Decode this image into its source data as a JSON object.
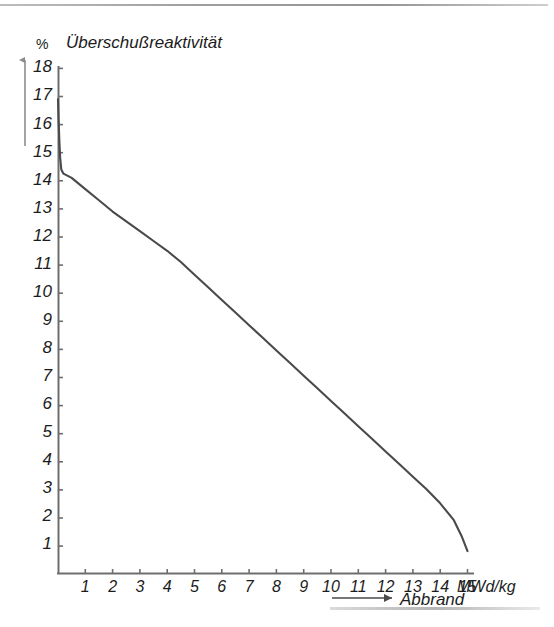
{
  "page": {
    "background": "#ffffff",
    "ink_color": "#2b2b2b",
    "axis_color": "#6e6e6e",
    "curve_color": "#4a4a4a"
  },
  "chart_data": {
    "type": "line",
    "title": "Überschußreaktivität",
    "xlabel": "Abbrand",
    "ylabel": "%",
    "x_unit": "15MWd/kg",
    "x_unit_text": "MWd/kg",
    "xlim": [
      0,
      15.5
    ],
    "ylim": [
      0,
      18
    ],
    "grid": false,
    "legend": "Abbrand",
    "legend_position": "below-x-axis-right",
    "xticks": [
      "1",
      "2",
      "3",
      "4",
      "5",
      "6",
      "7",
      "8",
      "9",
      "10",
      "11",
      "12",
      "13",
      "14",
      "15"
    ],
    "xtick_values": [
      1,
      2,
      3,
      4,
      5,
      6,
      7,
      8,
      9,
      10,
      11,
      12,
      13,
      14,
      15
    ],
    "yticks": [
      "1",
      "2",
      "3",
      "4",
      "5",
      "6",
      "7",
      "8",
      "9",
      "10",
      "11",
      "12",
      "13",
      "14",
      "15",
      "16",
      "17",
      "18"
    ],
    "ytick_values": [
      1,
      2,
      3,
      4,
      5,
      6,
      7,
      8,
      9,
      10,
      11,
      12,
      13,
      14,
      15,
      16,
      17,
      18
    ],
    "series": [
      {
        "name": "Überschußreaktivität",
        "points": [
          [
            0.0,
            16.9
          ],
          [
            0.02,
            16.2
          ],
          [
            0.05,
            15.4
          ],
          [
            0.08,
            14.8
          ],
          [
            0.12,
            14.4
          ],
          [
            0.2,
            14.25
          ],
          [
            0.5,
            14.1
          ],
          [
            1.0,
            13.7
          ],
          [
            1.5,
            13.3
          ],
          [
            2.0,
            12.9
          ],
          [
            2.5,
            12.55
          ],
          [
            3.0,
            12.2
          ],
          [
            3.5,
            11.85
          ],
          [
            4.0,
            11.5
          ],
          [
            4.5,
            11.1
          ],
          [
            5.0,
            10.65
          ],
          [
            5.5,
            10.2
          ],
          [
            6.0,
            9.75
          ],
          [
            6.5,
            9.3
          ],
          [
            7.0,
            8.85
          ],
          [
            7.5,
            8.4
          ],
          [
            8.0,
            7.95
          ],
          [
            8.5,
            7.5
          ],
          [
            9.0,
            7.05
          ],
          [
            9.5,
            6.6
          ],
          [
            10.0,
            6.15
          ],
          [
            10.5,
            5.7
          ],
          [
            11.0,
            5.25
          ],
          [
            11.5,
            4.8
          ],
          [
            12.0,
            4.35
          ],
          [
            12.5,
            3.9
          ],
          [
            13.0,
            3.45
          ],
          [
            13.5,
            3.0
          ],
          [
            14.0,
            2.5
          ],
          [
            14.5,
            1.9
          ],
          [
            14.8,
            1.3
          ],
          [
            15.0,
            0.8
          ]
        ]
      }
    ],
    "annotations": [
      {
        "name": "y-axis-arrow",
        "direction": "up",
        "note": "grey arrow left of y axis"
      },
      {
        "name": "legend-arrow",
        "direction": "right",
        "note": "arrow preceding the Abbrand legend text"
      }
    ]
  }
}
